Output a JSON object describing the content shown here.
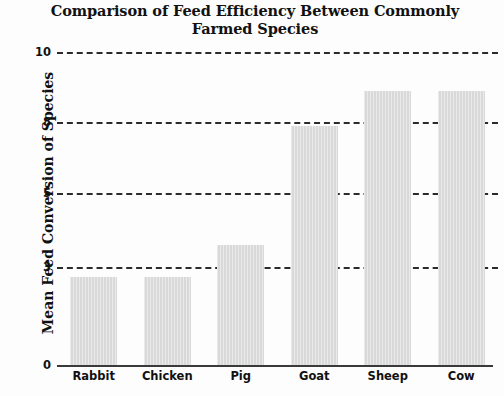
{
  "chart_data": {
    "type": "bar",
    "title": "Comparison of Feed Efficiency Between Commonly Farmed Species",
    "title_line1": "Comparison of Feed Efficiency Between Commonly",
    "title_line2": "Farmed Species",
    "xlabel": "",
    "ylabel": "Mean Feed Conversion of Species",
    "categories": [
      "Rabbit",
      "Chicken",
      "Pig",
      "Goat",
      "Sheep",
      "Cow"
    ],
    "values": [
      2.7,
      2.7,
      3.6,
      7.85,
      8.9,
      8.9
    ],
    "ytick_labels": [
      "0",
      "3",
      "5",
      "8",
      "10"
    ],
    "ytick_values": [
      0,
      3,
      5,
      8,
      10
    ],
    "ylim": [
      0,
      10
    ],
    "grid": true,
    "grid_style": "dashed-horizontal",
    "legend": "none",
    "bar_color": "#d9d9d9",
    "grid_color": "#2b2b2b",
    "axis_color": "#3a3a3a",
    "text_color": "#111111",
    "background_color": "#fdfdfd"
  }
}
